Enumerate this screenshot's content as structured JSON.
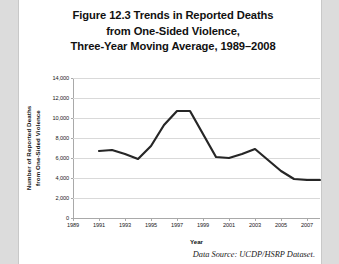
{
  "figure": {
    "title_lines": [
      "Figure 12.3 Trends in Reported Deaths",
      "from One-Sided Violence,",
      "Three-Year Moving Average, 1989–2008"
    ],
    "source_note": "Data Source: UCDP/HSRP Dataset.",
    "line_color": "#262626",
    "grid_color": "#d9d9d9",
    "axis_color": "#a9a9a9",
    "plot_background": "#ffffff",
    "page_background": "#ffffff",
    "surround_background": "#dcdcdc"
  },
  "chart_data": {
    "type": "line",
    "title": "Figure 12.3 Trends in Reported Deaths from One-Sided Violence, Three-Year Moving Average, 1989–2008",
    "xlabel": "Year",
    "ylabel": "Number of Reported Deaths from One-Sided Violence",
    "ylabel_lines": [
      "Number of Reported Deaths",
      "from One-Sided Violence"
    ],
    "grid": true,
    "legend": "none",
    "xlim": [
      1989,
      2008
    ],
    "ylim": [
      0,
      14000
    ],
    "ytick_labels": [
      "0",
      "2,000",
      "4,000",
      "6,000",
      "8,000",
      "10,000",
      "12,000",
      "14,000"
    ],
    "ytick_values": [
      0,
      2000,
      4000,
      6000,
      8000,
      10000,
      12000,
      14000
    ],
    "xtick_labels": [
      "1989",
      "1991",
      "1993",
      "1995",
      "1997",
      "1999",
      "2001",
      "2003",
      "2005",
      "2007"
    ],
    "xtick_values": [
      1989,
      1991,
      1993,
      1995,
      1997,
      1999,
      2001,
      2003,
      2005,
      2007
    ],
    "x": [
      1991,
      1992,
      1993,
      1994,
      1995,
      1996,
      1997,
      1998,
      1999,
      2000,
      2001,
      2002,
      2003,
      2004,
      2005,
      2006,
      2007,
      2008
    ],
    "series": [
      {
        "name": "Reported deaths from one-sided violence (3-year moving average)",
        "values": [
          6700,
          6800,
          6400,
          5900,
          7200,
          9300,
          10700,
          10700,
          8400,
          6100,
          6000,
          6400,
          6900,
          5800,
          4700,
          3900,
          3800,
          3800
        ]
      }
    ]
  }
}
